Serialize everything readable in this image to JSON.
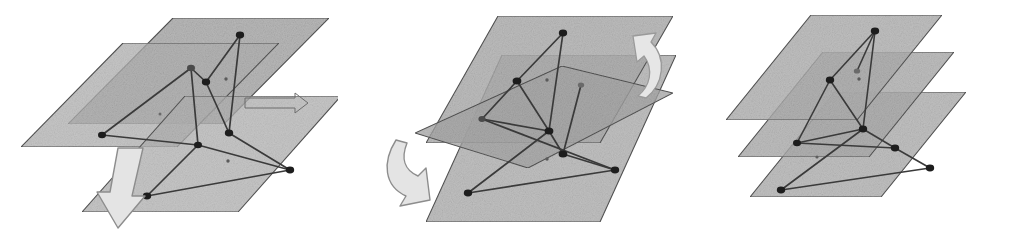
{
  "figure": {
    "panel_count": 3,
    "background_color": "#ffffff",
    "stroke_color": "#3a3a3a",
    "node_color": "#1e1e1e",
    "plane_fill": "#b3b3b3",
    "plane_fill_dark": "#8e8e8e",
    "plane_stroke": "#555555",
    "arrow_fill": "#e2e2e2",
    "arrow_stroke": "#8a8a8a"
  },
  "panels": [
    {
      "id": "panel-1",
      "name": "initial-offset-layers",
      "caption": "",
      "plane_count": 3,
      "planes": [
        {
          "name": "top-plane",
          "points": "173,18 329,18 224,124 68,124"
        },
        {
          "name": "middle-plane",
          "points": "123,43 279,43 177,147 21,147"
        },
        {
          "name": "bottom-plane",
          "points": "185,96 341,96 238,212 82,212"
        }
      ],
      "arrows": [
        {
          "name": "translate-arrow-down-left",
          "kind": "straight",
          "direction": "down-left"
        },
        {
          "name": "small-plane-arrow-right",
          "kind": "outline",
          "direction": "right"
        }
      ],
      "nodes": [
        {
          "name": "node-a",
          "x": 240,
          "y": 35
        },
        {
          "name": "node-b",
          "x": 191,
          "y": 68
        },
        {
          "name": "node-c",
          "x": 206,
          "y": 82
        },
        {
          "name": "node-d",
          "x": 229,
          "y": 133
        },
        {
          "name": "node-e",
          "x": 102,
          "y": 135
        },
        {
          "name": "node-f",
          "x": 198,
          "y": 145
        },
        {
          "name": "node-g",
          "x": 290,
          "y": 170
        },
        {
          "name": "node-h",
          "x": 147,
          "y": 196
        },
        {
          "name": "node-small-1",
          "x": 226,
          "y": 79
        },
        {
          "name": "node-small-2",
          "x": 160,
          "y": 114
        },
        {
          "name": "node-small-3",
          "x": 228,
          "y": 161
        }
      ],
      "edges": [
        [
          "node-a",
          "node-c"
        ],
        [
          "node-a",
          "node-d"
        ],
        [
          "node-b",
          "node-c"
        ],
        [
          "node-b",
          "node-e"
        ],
        [
          "node-b",
          "node-f"
        ],
        [
          "node-c",
          "node-d"
        ],
        [
          "node-d",
          "node-g"
        ],
        [
          "node-e",
          "node-f"
        ],
        [
          "node-f",
          "node-g"
        ],
        [
          "node-g",
          "node-h"
        ],
        [
          "node-h",
          "node-f"
        ]
      ]
    },
    {
      "id": "panel-2",
      "name": "rotating-layers",
      "caption": "",
      "plane_count": 3,
      "planes": [
        {
          "name": "top-plane",
          "points": "160,16 335,16 262,143 88,143"
        },
        {
          "name": "tilted-plane",
          "points": "77,133 224,66 335,93 190,168"
        },
        {
          "name": "bottom-plane",
          "points": "164,55 338,55 262,222 88,222"
        }
      ],
      "arrows": [
        {
          "name": "rotate-arrow-left",
          "kind": "curved",
          "direction": "down-left"
        },
        {
          "name": "rotate-arrow-right",
          "kind": "curved",
          "direction": "up-right"
        }
      ],
      "nodes": [
        {
          "name": "node-a",
          "x": 225,
          "y": 33
        },
        {
          "name": "node-b",
          "x": 179,
          "y": 81
        },
        {
          "name": "node-c",
          "x": 211,
          "y": 131
        },
        {
          "name": "node-d",
          "x": 144,
          "y": 119
        },
        {
          "name": "node-e",
          "x": 225,
          "y": 154
        },
        {
          "name": "node-f",
          "x": 277,
          "y": 170
        },
        {
          "name": "node-g",
          "x": 130,
          "y": 193
        },
        {
          "name": "node-h",
          "x": 243,
          "y": 85
        },
        {
          "name": "node-small-1",
          "x": 209,
          "y": 80
        },
        {
          "name": "node-small-2",
          "x": 209,
          "y": 159
        }
      ],
      "edges": [
        [
          "node-a",
          "node-b"
        ],
        [
          "node-a",
          "node-c"
        ],
        [
          "node-b",
          "node-c"
        ],
        [
          "node-b",
          "node-d"
        ],
        [
          "node-c",
          "node-d"
        ],
        [
          "node-c",
          "node-e"
        ],
        [
          "node-e",
          "node-h"
        ],
        [
          "node-e",
          "node-f"
        ],
        [
          "node-f",
          "node-g"
        ],
        [
          "node-g",
          "node-c"
        ],
        [
          "node-d",
          "node-f"
        ]
      ]
    },
    {
      "id": "panel-3",
      "name": "aligned-parallel-layers",
      "caption": "",
      "plane_count": 3,
      "planes": [
        {
          "name": "top-plane",
          "points": "134,15 265,15 180,120 49,120"
        },
        {
          "name": "middle-plane",
          "points": "146,52 277,52 192,157 61,157"
        },
        {
          "name": "bottom-plane",
          "points": "158,92 289,92 204,197 73,197"
        }
      ],
      "arrows": [],
      "nodes": [
        {
          "name": "node-a",
          "x": 198,
          "y": 31
        },
        {
          "name": "node-b",
          "x": 153,
          "y": 80
        },
        {
          "name": "node-c",
          "x": 186,
          "y": 129
        },
        {
          "name": "node-d",
          "x": 120,
          "y": 143
        },
        {
          "name": "node-e",
          "x": 218,
          "y": 148
        },
        {
          "name": "node-f",
          "x": 253,
          "y": 168
        },
        {
          "name": "node-g",
          "x": 104,
          "y": 190
        },
        {
          "name": "node-h",
          "x": 180,
          "y": 71
        },
        {
          "name": "node-small-1",
          "x": 182,
          "y": 79
        },
        {
          "name": "node-small-2",
          "x": 140,
          "y": 157
        }
      ],
      "edges": [
        [
          "node-a",
          "node-b"
        ],
        [
          "node-a",
          "node-c"
        ],
        [
          "node-b",
          "node-c"
        ],
        [
          "node-b",
          "node-d"
        ],
        [
          "node-c",
          "node-d"
        ],
        [
          "node-c",
          "node-e"
        ],
        [
          "node-d",
          "node-e"
        ],
        [
          "node-e",
          "node-f"
        ],
        [
          "node-f",
          "node-g"
        ],
        [
          "node-g",
          "node-c"
        ],
        [
          "node-a",
          "node-h"
        ]
      ]
    }
  ]
}
